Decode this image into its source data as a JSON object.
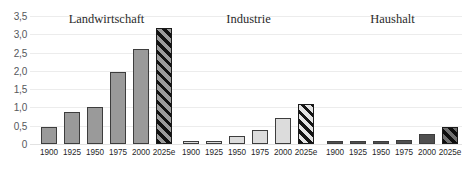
{
  "chart_data": {
    "type": "bar",
    "title": "",
    "xlabel": "",
    "ylabel": "",
    "ylim": [
      0,
      3.5
    ],
    "ytick_labels": [
      "0",
      "0,5",
      "1,0",
      "1,5",
      "2,0",
      "2,5",
      "3,0",
      "3,5"
    ],
    "ytick_values": [
      0,
      0.5,
      1.0,
      1.5,
      2.0,
      2.5,
      3.0,
      3.5
    ],
    "grid": true,
    "legend": "none",
    "categories": [
      "1900",
      "1925",
      "1950",
      "1975",
      "2000",
      "2025e"
    ],
    "panels": [
      {
        "name": "Landwirtschaft",
        "values": [
          0.46,
          0.87,
          1.02,
          1.97,
          2.6,
          3.18
        ],
        "fill": "#9a9a9a",
        "forecast_index": 5
      },
      {
        "name": "Industrie",
        "values": [
          0.05,
          0.09,
          0.21,
          0.37,
          0.72,
          1.1
        ],
        "fill": "#dcdcdc",
        "forecast_index": 5
      },
      {
        "name": "Haushalt",
        "values": [
          0.03,
          0.05,
          0.07,
          0.12,
          0.27,
          0.46
        ],
        "fill": "#4f4f4f",
        "forecast_index": 5
      }
    ],
    "colors": {
      "gridline": "#ececec",
      "bar_outline": "#3d3d3d",
      "axis_text": "#55585c",
      "title_text": "#2a2a2a",
      "background": "#ffffff"
    }
  }
}
